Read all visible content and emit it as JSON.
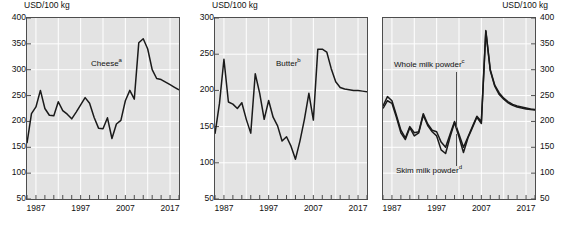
{
  "figure": {
    "width": 566,
    "height": 234,
    "panel_count": 3,
    "plot_bg": "#e3e3e3",
    "line_color": "#1a1a1a",
    "grid_color": "#ffffff",
    "axis_color": "#4d4d4d"
  },
  "chart_data": [
    {
      "type": "line",
      "title": "",
      "ylabel": "USD/100 kg",
      "ylabel_position": "top-left",
      "xlabel": "",
      "ylim": [
        50,
        400
      ],
      "yticks": [
        50,
        100,
        150,
        200,
        250,
        300,
        350,
        400
      ],
      "ytick_labels": [
        "50",
        "100",
        "150",
        "200",
        "250",
        "300",
        "350",
        "400"
      ],
      "xlim": [
        1985,
        2019
      ],
      "xticks": [
        1987,
        1997,
        2007,
        2017
      ],
      "xtick_labels": [
        "1987",
        "1997",
        "2007",
        "2017"
      ],
      "xminor_step": 2,
      "grid": true,
      "legend": "inline-annotation",
      "series": [
        {
          "name": "Cheese",
          "footnote": "a",
          "label_text": "Cheese",
          "x": [
            1985,
            1986,
            1987,
            1988,
            1989,
            1990,
            1991,
            1992,
            1993,
            1994,
            1995,
            1996,
            1997,
            1998,
            1999,
            2000,
            2001,
            2002,
            2003,
            2004,
            2005,
            2006,
            2007,
            2008,
            2009,
            2010,
            2011,
            2012,
            2013,
            2014,
            2015,
            2016,
            2017,
            2018,
            2019
          ],
          "values": [
            158,
            215,
            228,
            260,
            225,
            212,
            211,
            238,
            221,
            214,
            205,
            218,
            232,
            246,
            235,
            208,
            187,
            186,
            207,
            167,
            195,
            202,
            240,
            260,
            243,
            352,
            360,
            340,
            300,
            283,
            281,
            276,
            271,
            266,
            261
          ]
        }
      ]
    },
    {
      "type": "line",
      "title": "",
      "ylabel": "USD/100 kg",
      "ylabel_position": "top-left",
      "xlabel": "",
      "ylim": [
        50,
        300
      ],
      "yticks": [
        50,
        100,
        150,
        200,
        250,
        300
      ],
      "ytick_labels": [
        "50",
        "100",
        "150",
        "200",
        "250",
        "300"
      ],
      "xlim": [
        1985,
        2019
      ],
      "xticks": [
        1987,
        1997,
        2007,
        2017
      ],
      "xtick_labels": [
        "1987",
        "1997",
        "2007",
        "2017"
      ],
      "xminor_step": 2,
      "grid": true,
      "legend": "inline-annotation",
      "series": [
        {
          "name": "Butter",
          "footnote": "b",
          "label_text": "Butter",
          "x": [
            1985,
            1986,
            1987,
            1988,
            1989,
            1990,
            1991,
            1992,
            1993,
            1994,
            1995,
            1996,
            1997,
            1998,
            1999,
            2000,
            2001,
            2002,
            2003,
            2004,
            2005,
            2006,
            2007,
            2008,
            2009,
            2010,
            2011,
            2012,
            2013,
            2014,
            2015,
            2016,
            2017,
            2018,
            2019
          ],
          "values": [
            140,
            182,
            243,
            184,
            181,
            175,
            183,
            160,
            141,
            223,
            196,
            160,
            186,
            163,
            151,
            130,
            136,
            123,
            105,
            130,
            160,
            196,
            159,
            257,
            257,
            253,
            230,
            212,
            204,
            202,
            201,
            200,
            200,
            199,
            198
          ]
        }
      ]
    },
    {
      "type": "line",
      "title": "",
      "ylabel": "USD/100 kg",
      "ylabel_position": "top-right",
      "xlabel": "",
      "ylim": [
        50,
        400
      ],
      "yticks": [
        50,
        100,
        150,
        200,
        250,
        300,
        350,
        400
      ],
      "ytick_labels": [
        "50",
        "100",
        "150",
        "200",
        "250",
        "300",
        "350",
        "400"
      ],
      "xlim": [
        1985,
        2019
      ],
      "xticks": [
        1987,
        1997,
        2007,
        2017
      ],
      "xtick_labels": [
        "1987",
        "1997",
        "2007",
        "2017"
      ],
      "xminor_step": 2,
      "grid": true,
      "legend": "inline-annotation",
      "series": [
        {
          "name": "Whole milk powder",
          "footnote": "c",
          "label_text": "Whole milk powder",
          "x": [
            1985,
            1986,
            1987,
            1988,
            1989,
            1990,
            1991,
            1992,
            1993,
            1994,
            1995,
            1996,
            1997,
            1998,
            1999,
            2000,
            2001,
            2002,
            2003,
            2004,
            2005,
            2006,
            2007,
            2008,
            2009,
            2010,
            2011,
            2012,
            2013,
            2014,
            2015,
            2016,
            2017,
            2018,
            2019
          ],
          "values": [
            230,
            248,
            240,
            212,
            183,
            168,
            190,
            178,
            180,
            215,
            195,
            183,
            180,
            160,
            150,
            175,
            200,
            175,
            150,
            170,
            190,
            210,
            200,
            376,
            300,
            270,
            255,
            245,
            238,
            233,
            230,
            228,
            226,
            224,
            223
          ]
        },
        {
          "name": "Skim milk powder",
          "footnote": "d",
          "label_text": "Skim milk powder",
          "x": [
            1985,
            1986,
            1987,
            1988,
            1989,
            1990,
            1991,
            1992,
            1993,
            1994,
            1995,
            1996,
            1997,
            1998,
            1999,
            2000,
            2001,
            2002,
            2003,
            2004,
            2005,
            2006,
            2007,
            2008,
            2009,
            2010,
            2011,
            2012,
            2013,
            2014,
            2015,
            2016,
            2017,
            2018,
            2019
          ],
          "values": [
            225,
            240,
            235,
            208,
            178,
            165,
            188,
            172,
            178,
            212,
            192,
            180,
            172,
            145,
            138,
            170,
            198,
            170,
            140,
            168,
            188,
            208,
            196,
            374,
            298,
            268,
            252,
            243,
            236,
            231,
            228,
            226,
            224,
            223,
            222
          ]
        }
      ]
    }
  ],
  "panels": [
    {
      "axis_title": "USD/100 kg",
      "label_cheese": "Cheese",
      "label_cheese_sup": "a"
    },
    {
      "axis_title": "USD/100 kg",
      "label_butter": "Butter",
      "label_butter_sup": "b"
    },
    {
      "axis_title": "USD/100 kg",
      "label_whole": "Whole milk powder",
      "label_whole_sup": "c",
      "label_skim": "Skim milk powder",
      "label_skim_sup": "d"
    }
  ]
}
